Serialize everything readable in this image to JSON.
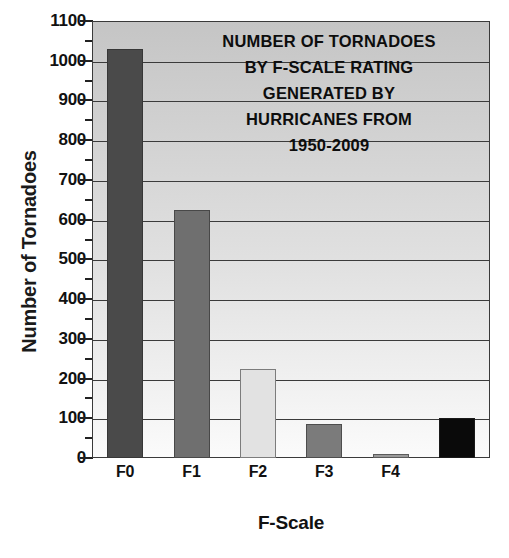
{
  "chart_data": {
    "type": "bar",
    "title_lines": [
      "NUMBER OF TORNADOES",
      "BY F-SCALE RATING",
      "GENERATED BY",
      "HURRICANES FROM",
      "1950-2009"
    ],
    "xlabel": "F-Scale",
    "ylabel": "Number of Tornadoes",
    "categories": [
      "F0",
      "F1",
      "F2",
      "F3",
      "F4",
      "Unknown"
    ],
    "values": [
      1030,
      625,
      225,
      85,
      10,
      100
    ],
    "ylim": [
      0,
      1100
    ],
    "ytick_labels": [
      "0",
      "100",
      "200",
      "300",
      "400",
      "500",
      "600",
      "700",
      "800",
      "900",
      "1000",
      "1100"
    ],
    "ytick_values": [
      0,
      100,
      200,
      300,
      400,
      500,
      600,
      700,
      800,
      900,
      1000,
      1100
    ],
    "yminor_interval": 50,
    "grid": true,
    "legend": "none",
    "bar_colors": [
      "#4a4a4a",
      "#6f6f6f",
      "#e2e2e2",
      "#7b7b7b",
      "#9a9a9a",
      "#0a0a0a"
    ],
    "rotated_tick_labels": [
      "Unknown"
    ],
    "plot_background_top": "#c5c5c5",
    "plot_background_bottom": "#fbfbfb",
    "axis_color": "#3b3b3b",
    "text_color": "#111111"
  }
}
